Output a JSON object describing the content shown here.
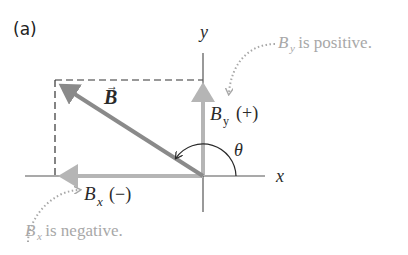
{
  "panel_label": "(a)",
  "axes": {
    "x_label": "x",
    "y_label": "y"
  },
  "vector": {
    "name": "B",
    "arrow_symbol": "→"
  },
  "components": {
    "bx": {
      "symbol": "B",
      "subscript": "x",
      "sign": "(−)"
    },
    "by": {
      "symbol": "B",
      "subscript": "y",
      "sign": "(+)"
    }
  },
  "angle_label": "θ",
  "annotations": {
    "by_note": {
      "symbol": "B",
      "subscript": "y",
      "text": " is positive."
    },
    "bx_note": {
      "symbol": "B",
      "subscript": "x",
      "text": " is negative."
    }
  },
  "colors": {
    "axis": "#555555",
    "vector": "#8a8a8a",
    "component": "#b5b5b5",
    "annotation": "#a8a8a8",
    "dash": "#333333"
  }
}
